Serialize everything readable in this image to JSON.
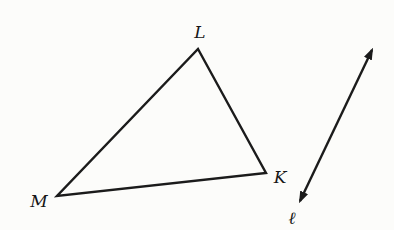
{
  "figure": {
    "background_color": "#fcfcfa",
    "stroke_color": "#1b1b1b",
    "stroke_width": 2.4,
    "width": 394,
    "height": 230,
    "triangle": {
      "name": "triangle LMK",
      "vertices": [
        {
          "label": "L",
          "x": 198,
          "y": 49,
          "label_x": 200,
          "label_y": 38
        },
        {
          "label": "K",
          "x": 266,
          "y": 173,
          "label_x": 280,
          "label_y": 183
        },
        {
          "label": "M",
          "x": 57,
          "y": 196,
          "label_x": 39,
          "label_y": 207
        }
      ]
    },
    "line": {
      "label": "ℓ",
      "x1": 300,
      "y1": 201,
      "x2": 372,
      "y2": 50,
      "arrow_start": true,
      "arrow_end": true,
      "label_x": 292,
      "label_y": 224
    }
  }
}
